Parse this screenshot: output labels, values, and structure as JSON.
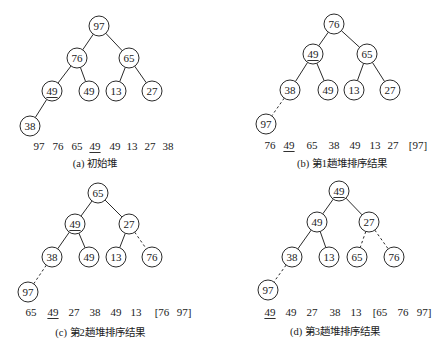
{
  "figure": {
    "colors": {
      "stroke": "#2a2a2a",
      "text": "#1a1a1a",
      "background": "#ffffff"
    },
    "node_radius": 10,
    "panels": [
      {
        "id": "a",
        "caption": "(a) 初始堆",
        "caption_pos": [
          95,
          163
        ],
        "nodes": [
          {
            "label": "97",
            "x": 99,
            "y": 26,
            "underline": false
          },
          {
            "label": "76",
            "x": 77,
            "y": 58,
            "underline": false
          },
          {
            "label": "65",
            "x": 129,
            "y": 58,
            "underline": false
          },
          {
            "label": "49",
            "x": 52,
            "y": 91,
            "underline": true
          },
          {
            "label": "49",
            "x": 89,
            "y": 91,
            "underline": false
          },
          {
            "label": "13",
            "x": 116,
            "y": 91,
            "underline": false
          },
          {
            "label": "27",
            "x": 152,
            "y": 91,
            "underline": false
          },
          {
            "label": "38",
            "x": 30,
            "y": 126,
            "underline": false
          }
        ],
        "edges": [
          {
            "from": 0,
            "to": 1,
            "dashed": false
          },
          {
            "from": 0,
            "to": 2,
            "dashed": false
          },
          {
            "from": 1,
            "to": 3,
            "dashed": false
          },
          {
            "from": 1,
            "to": 4,
            "dashed": false
          },
          {
            "from": 2,
            "to": 5,
            "dashed": false
          },
          {
            "from": 2,
            "to": 6,
            "dashed": false
          },
          {
            "from": 3,
            "to": 7,
            "dashed": false
          }
        ],
        "array_y": 146,
        "array": [
          {
            "text": "97",
            "x": 39,
            "underline": false
          },
          {
            "text": "76",
            "x": 58,
            "underline": false
          },
          {
            "text": "65",
            "x": 77,
            "underline": false
          },
          {
            "text": "49",
            "x": 95,
            "underline": true
          },
          {
            "text": "49",
            "x": 115,
            "underline": false
          },
          {
            "text": "13",
            "x": 132,
            "underline": false
          },
          {
            "text": "27",
            "x": 150,
            "underline": false
          },
          {
            "text": "38",
            "x": 168,
            "underline": false
          }
        ]
      },
      {
        "id": "b",
        "caption": "(b) 第1趟堆排序结果",
        "caption_pos": [
          342,
          163
        ],
        "nodes": [
          {
            "label": "76",
            "x": 334,
            "y": 24,
            "underline": false
          },
          {
            "label": "49",
            "x": 313,
            "y": 54,
            "underline": true
          },
          {
            "label": "65",
            "x": 367,
            "y": 54,
            "underline": false
          },
          {
            "label": "38",
            "x": 290,
            "y": 90,
            "underline": false
          },
          {
            "label": "49",
            "x": 328,
            "y": 90,
            "underline": false
          },
          {
            "label": "13",
            "x": 354,
            "y": 90,
            "underline": false
          },
          {
            "label": "27",
            "x": 390,
            "y": 90,
            "underline": false
          },
          {
            "label": "97",
            "x": 266,
            "y": 124,
            "underline": false
          }
        ],
        "edges": [
          {
            "from": 0,
            "to": 1,
            "dashed": false
          },
          {
            "from": 0,
            "to": 2,
            "dashed": false
          },
          {
            "from": 1,
            "to": 3,
            "dashed": false
          },
          {
            "from": 1,
            "to": 4,
            "dashed": false
          },
          {
            "from": 2,
            "to": 5,
            "dashed": false
          },
          {
            "from": 2,
            "to": 6,
            "dashed": false
          },
          {
            "from": 3,
            "to": 7,
            "dashed": true
          }
        ],
        "array_y": 145,
        "array": [
          {
            "text": "76",
            "x": 270,
            "underline": false
          },
          {
            "text": "49",
            "x": 289,
            "underline": true
          },
          {
            "text": "65",
            "x": 312,
            "underline": false
          },
          {
            "text": "38",
            "x": 334,
            "underline": false
          },
          {
            "text": "49",
            "x": 355,
            "underline": false
          },
          {
            "text": "13",
            "x": 375,
            "underline": false
          },
          {
            "text": "27",
            "x": 393,
            "underline": false
          },
          {
            "text": "[97]",
            "x": 418,
            "underline": false
          }
        ]
      },
      {
        "id": "c",
        "caption": "(c) 第2趟堆排序结果",
        "caption_pos": [
          100,
          332
        ],
        "nodes": [
          {
            "label": "65",
            "x": 98,
            "y": 193,
            "underline": false
          },
          {
            "label": "49",
            "x": 75,
            "y": 224,
            "underline": true
          },
          {
            "label": "27",
            "x": 129,
            "y": 224,
            "underline": false
          },
          {
            "label": "38",
            "x": 52,
            "y": 257,
            "underline": false
          },
          {
            "label": "49",
            "x": 89,
            "y": 257,
            "underline": false
          },
          {
            "label": "13",
            "x": 116,
            "y": 257,
            "underline": false
          },
          {
            "label": "76",
            "x": 152,
            "y": 257,
            "underline": false
          },
          {
            "label": "97",
            "x": 28,
            "y": 292,
            "underline": false
          }
        ],
        "edges": [
          {
            "from": 0,
            "to": 1,
            "dashed": false
          },
          {
            "from": 0,
            "to": 2,
            "dashed": false
          },
          {
            "from": 1,
            "to": 3,
            "dashed": false
          },
          {
            "from": 1,
            "to": 4,
            "dashed": false
          },
          {
            "from": 2,
            "to": 5,
            "dashed": false
          },
          {
            "from": 2,
            "to": 6,
            "dashed": true
          },
          {
            "from": 3,
            "to": 7,
            "dashed": true
          }
        ],
        "array_y": 312,
        "array": [
          {
            "text": "65",
            "x": 31,
            "underline": false
          },
          {
            "text": "49",
            "x": 53,
            "underline": true
          },
          {
            "text": "27",
            "x": 74,
            "underline": false
          },
          {
            "text": "38",
            "x": 95,
            "underline": false
          },
          {
            "text": "49",
            "x": 116,
            "underline": false
          },
          {
            "text": "13",
            "x": 136,
            "underline": false
          },
          {
            "text": "[76",
            "x": 162,
            "underline": false
          },
          {
            "text": "97]",
            "x": 184,
            "underline": false
          }
        ]
      },
      {
        "id": "d",
        "caption": "(d) 第3趟堆排序结果",
        "caption_pos": [
          335,
          331
        ],
        "nodes": [
          {
            "label": "49",
            "x": 339,
            "y": 191,
            "underline": true
          },
          {
            "label": "49",
            "x": 317,
            "y": 222,
            "underline": false
          },
          {
            "label": "27",
            "x": 369,
            "y": 222,
            "underline": false
          },
          {
            "label": "38",
            "x": 292,
            "y": 257,
            "underline": false
          },
          {
            "label": "13",
            "x": 329,
            "y": 257,
            "underline": false
          },
          {
            "label": "65",
            "x": 357,
            "y": 257,
            "underline": false
          },
          {
            "label": "76",
            "x": 394,
            "y": 257,
            "underline": false
          },
          {
            "label": "97",
            "x": 268,
            "y": 290,
            "underline": false
          }
        ],
        "edges": [
          {
            "from": 0,
            "to": 1,
            "dashed": false
          },
          {
            "from": 0,
            "to": 2,
            "dashed": false
          },
          {
            "from": 1,
            "to": 3,
            "dashed": false
          },
          {
            "from": 1,
            "to": 4,
            "dashed": false
          },
          {
            "from": 2,
            "to": 5,
            "dashed": true
          },
          {
            "from": 2,
            "to": 6,
            "dashed": true
          },
          {
            "from": 3,
            "to": 7,
            "dashed": true
          }
        ],
        "array_y": 312,
        "array": [
          {
            "text": "49",
            "x": 270,
            "underline": true
          },
          {
            "text": "49",
            "x": 291,
            "underline": false
          },
          {
            "text": "27",
            "x": 312,
            "underline": false
          },
          {
            "text": "38",
            "x": 335,
            "underline": false
          },
          {
            "text": "13",
            "x": 356,
            "underline": false
          },
          {
            "text": "[65",
            "x": 380,
            "underline": false
          },
          {
            "text": "76",
            "x": 403,
            "underline": false
          },
          {
            "text": "97]",
            "x": 424,
            "underline": false
          }
        ]
      }
    ]
  }
}
